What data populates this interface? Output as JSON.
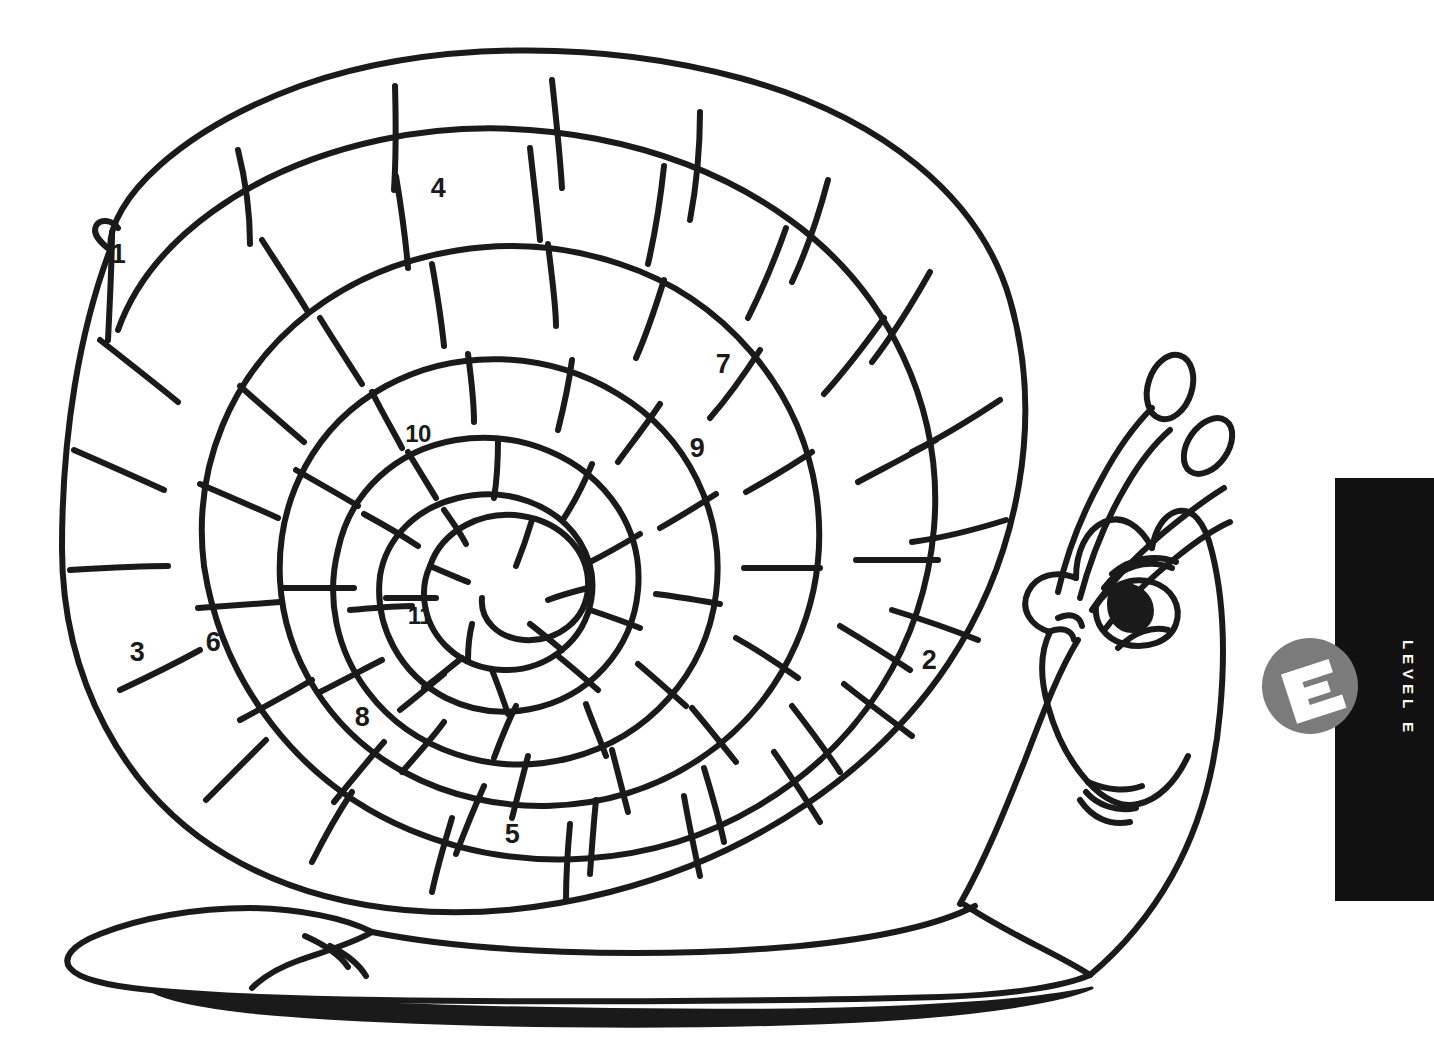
{
  "page": {
    "width": 1434,
    "height": 1064,
    "background": "#ffffff",
    "kind": "coloring-page-worksheet"
  },
  "artwork": {
    "subject": "cartoon snail with numbered spiral shell",
    "line_color": "#1a1a1a",
    "fill_color": "#ffffff",
    "description": "Black-and-white line drawing of a smiling snail facing right. Its large spiral shell is divided into segmented tiles, several of which are labeled with numbers."
  },
  "shell_numbers": [
    {
      "label": "1",
      "x": 118,
      "y": 254
    },
    {
      "label": "4",
      "x": 438,
      "y": 188
    },
    {
      "label": "7",
      "x": 723,
      "y": 364
    },
    {
      "label": "10",
      "x": 418,
      "y": 434
    },
    {
      "label": "9",
      "x": 697,
      "y": 448
    },
    {
      "label": "11",
      "x": 420,
      "y": 616
    },
    {
      "label": "3",
      "x": 137,
      "y": 652
    },
    {
      "label": "6",
      "x": 213,
      "y": 642
    },
    {
      "label": "2",
      "x": 929,
      "y": 660
    },
    {
      "label": "8",
      "x": 362,
      "y": 717
    },
    {
      "label": "5",
      "x": 512,
      "y": 834
    }
  ],
  "level_tab": {
    "bar_color": "#111111",
    "bar": {
      "x": 1335,
      "y": 478,
      "width": 99,
      "height": 423
    },
    "label": "LEVEL E",
    "label_color": "#ffffff",
    "badge": {
      "letter": "E",
      "circle_color": "#7b7b7b",
      "letter_color": "#ffffff",
      "center_x": 1310,
      "center_y": 686,
      "radius": 48
    }
  }
}
